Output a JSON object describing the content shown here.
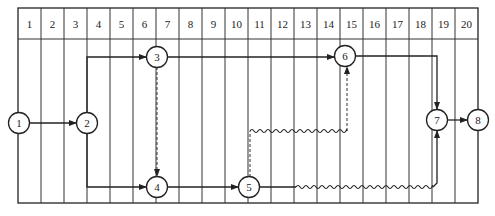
{
  "diagram": {
    "type": "time-scaled network diagram",
    "grid": {
      "left": 18,
      "right": 478,
      "top": 8,
      "header_bottom": 39,
      "bottom": 203,
      "columns": [
        "1",
        "2",
        "3",
        "4",
        "5",
        "6",
        "7",
        "8",
        "9",
        "10",
        "11",
        "12",
        "13",
        "14",
        "15",
        "16",
        "17",
        "18",
        "19",
        "20"
      ]
    },
    "nodes": [
      {
        "id": "1",
        "label": "1",
        "x": 19,
        "y": 123
      },
      {
        "id": "2",
        "label": "2",
        "x": 87,
        "y": 123
      },
      {
        "id": "3",
        "label": "3",
        "x": 157,
        "y": 57
      },
      {
        "id": "4",
        "label": "4",
        "x": 157,
        "y": 187
      },
      {
        "id": "5",
        "label": "5",
        "x": 249,
        "y": 187
      },
      {
        "id": "6",
        "label": "6",
        "x": 345,
        "y": 56
      },
      {
        "id": "7",
        "label": "7",
        "x": 437,
        "y": 120
      },
      {
        "id": "8",
        "label": "8",
        "x": 478,
        "y": 120
      }
    ],
    "edges": [
      {
        "from": "1",
        "to": "2",
        "style": "solid"
      },
      {
        "from": "2",
        "to": "3",
        "style": "solid"
      },
      {
        "from": "2",
        "to": "4",
        "style": "solid"
      },
      {
        "from": "3",
        "to": "6",
        "style": "solid"
      },
      {
        "from": "3",
        "to": "4",
        "style": "dashed"
      },
      {
        "from": "4",
        "to": "5",
        "style": "solid"
      },
      {
        "from": "5",
        "to": "6",
        "style": "dashed-with-float",
        "float_span": "11-14"
      },
      {
        "from": "5",
        "to": "7",
        "style": "solid-with-float",
        "float_span": "13-19"
      },
      {
        "from": "6",
        "to": "7",
        "style": "solid"
      },
      {
        "from": "7",
        "to": "8",
        "style": "solid"
      }
    ]
  }
}
